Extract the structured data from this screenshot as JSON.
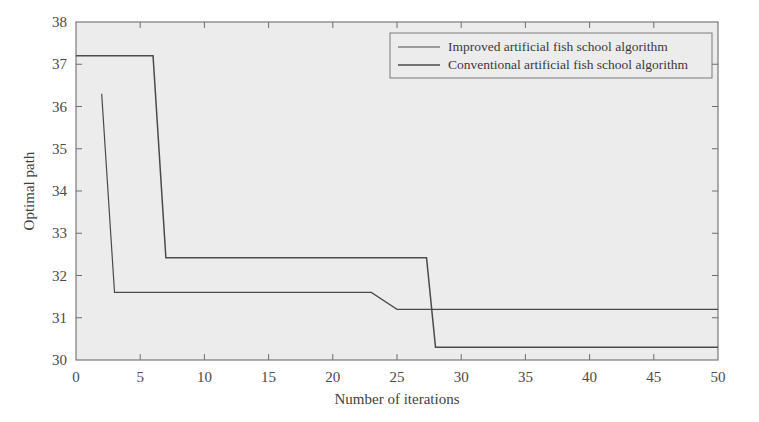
{
  "chart_data": {
    "type": "line",
    "title": "",
    "xlabel": "Number of iterations",
    "ylabel": "Optimal path",
    "xlim": [
      0,
      50
    ],
    "ylim": [
      30,
      38
    ],
    "xticks": [
      0,
      5,
      10,
      15,
      20,
      25,
      30,
      35,
      40,
      45,
      50
    ],
    "yticks": [
      30,
      31,
      32,
      33,
      34,
      35,
      36,
      37,
      38
    ],
    "xtick_labels": [
      "0",
      "5",
      "10",
      "15",
      "20",
      "25",
      "30",
      "35",
      "40",
      "45",
      "50"
    ],
    "ytick_labels": [
      "30",
      "31",
      "32",
      "33",
      "34",
      "35",
      "36",
      "37",
      "38"
    ],
    "grid": false,
    "legend_position": "top-right-inside",
    "plot_background": "#ececec",
    "line_color": "#4a4a4a",
    "series": [
      {
        "name": "Improved artificial fish school algorithm",
        "color": "#4a4a4a",
        "x": [
          2,
          3,
          23,
          25,
          50
        ],
        "y": [
          36.3,
          31.6,
          31.6,
          31.2,
          31.2
        ]
      },
      {
        "name": "Conventional artificial fish school algorithm",
        "color": "#4a4a4a",
        "x": [
          0,
          6,
          7,
          27.3,
          28,
          50
        ],
        "y": [
          37.2,
          37.2,
          32.42,
          32.42,
          30.3,
          30.3
        ]
      }
    ]
  },
  "legend": {
    "entries": [
      {
        "label": "Improved artificial fish school algorithm"
      },
      {
        "label": "Conventional artificial fish school algorithm"
      }
    ]
  },
  "axes": {
    "x_title": "Number of iterations",
    "y_title": "Optimal path"
  }
}
